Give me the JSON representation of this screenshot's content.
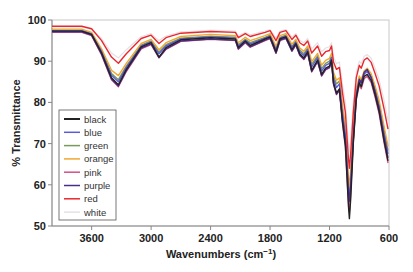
{
  "chart_data": {
    "type": "line",
    "title": "",
    "xlabel": "Wavenumbers (cm⁻¹)",
    "ylabel": "% Transmittance",
    "xlim": [
      4000,
      600
    ],
    "ylim": [
      50,
      100
    ],
    "x_reversed": true,
    "grid": false,
    "legend_position": "inside-left",
    "x_ticks": [
      3600,
      3000,
      2400,
      1800,
      1200,
      600
    ],
    "y_ticks": [
      50,
      60,
      70,
      80,
      90,
      100
    ],
    "x": [
      4000,
      3700,
      3600,
      3500,
      3400,
      3330,
      3250,
      3100,
      3000,
      2920,
      2850,
      2700,
      2400,
      2150,
      2120,
      2050,
      2000,
      1850,
      1800,
      1740,
      1700,
      1640,
      1580,
      1540,
      1500,
      1460,
      1420,
      1380,
      1320,
      1280,
      1240,
      1200,
      1180,
      1160,
      1130,
      1100,
      1070,
      1040,
      1010,
      1000,
      985,
      960,
      930,
      900,
      880,
      850,
      820,
      780,
      740,
      700,
      650,
      610
    ],
    "series": [
      {
        "name": "black",
        "color": "#222222",
        "values": [
          97.3,
          97.3,
          96.5,
          92.0,
          86.0,
          84.3,
          88.0,
          93.5,
          94.5,
          91.0,
          93.3,
          95.2,
          95.7,
          95.4,
          93.3,
          94.9,
          93.8,
          95.4,
          95.9,
          92.3,
          95.4,
          95.9,
          92.8,
          94.3,
          91.8,
          90.8,
          92.3,
          87.8,
          90.3,
          86.8,
          88.3,
          88.8,
          90.3,
          84.8,
          82.3,
          83.3,
          75.5,
          69.5,
          55.0,
          51.8,
          57.0,
          70.0,
          81.0,
          84.8,
          83.8,
          86.3,
          86.8,
          85.3,
          81.8,
          77.8,
          70.8,
          65.8
        ]
      },
      {
        "name": "blue",
        "color": "#5b5bd6",
        "values": [
          97.4,
          97.4,
          96.6,
          92.3,
          86.6,
          85.0,
          88.5,
          93.7,
          94.7,
          91.8,
          93.7,
          95.4,
          95.9,
          95.6,
          93.7,
          95.1,
          94.2,
          95.6,
          96.1,
          92.8,
          95.6,
          96.1,
          93.3,
          94.6,
          92.3,
          91.4,
          92.8,
          88.6,
          90.9,
          87.6,
          89.0,
          89.5,
          90.9,
          85.8,
          83.6,
          84.5,
          77.5,
          72.0,
          59.0,
          56.5,
          61.0,
          72.0,
          82.0,
          85.5,
          84.6,
          86.9,
          87.5,
          86.0,
          82.8,
          79.0,
          72.5,
          67.5
        ]
      },
      {
        "name": "green",
        "color": "#7a9a5a",
        "values": [
          97.5,
          97.5,
          96.7,
          92.6,
          87.0,
          85.5,
          88.8,
          93.9,
          94.9,
          92.2,
          94.0,
          95.6,
          96.1,
          95.8,
          94.0,
          95.3,
          94.5,
          95.8,
          96.3,
          93.1,
          95.8,
          96.3,
          93.6,
          94.9,
          92.7,
          91.8,
          93.2,
          89.2,
          91.3,
          88.2,
          89.5,
          90.0,
          91.3,
          86.5,
          84.5,
          85.2,
          78.5,
          73.0,
          60.5,
          58.0,
          62.5,
          73.0,
          82.6,
          85.9,
          85.0,
          87.2,
          87.8,
          86.4,
          83.3,
          79.7,
          73.3,
          68.3
        ]
      },
      {
        "name": "orange",
        "color": "#f0a830",
        "values": [
          97.8,
          97.8,
          97.0,
          93.0,
          87.8,
          86.5,
          89.5,
          94.3,
          95.3,
          92.8,
          94.5,
          96.0,
          96.5,
          96.2,
          94.5,
          95.8,
          95.0,
          96.2,
          96.7,
          93.6,
          96.2,
          96.7,
          94.1,
          95.3,
          93.2,
          92.4,
          93.7,
          89.9,
          91.9,
          89.0,
          90.2,
          90.7,
          91.9,
          87.3,
          85.4,
          86.0,
          79.5,
          74.0,
          62.0,
          59.5,
          64.0,
          74.0,
          83.2,
          86.4,
          85.5,
          87.7,
          88.3,
          87.0,
          84.0,
          80.5,
          74.3,
          69.3
        ]
      },
      {
        "name": "pink",
        "color": "#d4508a",
        "values": [
          97.0,
          97.0,
          96.2,
          91.5,
          85.5,
          83.8,
          87.5,
          93.0,
          94.0,
          90.8,
          92.9,
          94.8,
          95.3,
          95.0,
          92.9,
          94.5,
          93.4,
          95.0,
          95.5,
          91.9,
          95.0,
          95.5,
          92.4,
          93.9,
          91.4,
          90.4,
          91.9,
          87.4,
          89.9,
          86.4,
          87.9,
          88.4,
          89.9,
          84.4,
          81.9,
          82.9,
          75.0,
          69.0,
          56.0,
          53.5,
          58.5,
          70.5,
          80.6,
          84.3,
          83.3,
          85.8,
          86.3,
          84.8,
          81.3,
          77.3,
          70.3,
          65.3
        ]
      },
      {
        "name": "purple",
        "color": "#4a2d86",
        "values": [
          97.1,
          97.1,
          96.3,
          91.7,
          85.7,
          84.0,
          87.7,
          93.2,
          94.2,
          90.9,
          93.0,
          94.9,
          95.4,
          95.1,
          93.0,
          94.6,
          93.5,
          95.1,
          95.6,
          92.0,
          95.1,
          95.6,
          92.5,
          94.0,
          91.5,
          90.5,
          92.0,
          87.5,
          90.0,
          86.5,
          88.0,
          88.5,
          90.0,
          84.5,
          82.0,
          83.0,
          76.0,
          71.0,
          58.5,
          56.0,
          60.0,
          71.0,
          81.5,
          85.6,
          84.8,
          87.3,
          88.0,
          86.0,
          82.5,
          78.5,
          71.5,
          66.5
        ]
      },
      {
        "name": "red",
        "color": "#e8282d",
        "values": [
          98.5,
          98.5,
          97.9,
          95.0,
          91.0,
          89.5,
          91.8,
          95.5,
          96.3,
          94.3,
          95.7,
          96.8,
          97.2,
          97.0,
          95.7,
          96.7,
          96.0,
          97.0,
          97.4,
          95.0,
          97.0,
          97.4,
          95.3,
          96.3,
          94.5,
          93.8,
          94.9,
          92.0,
          93.7,
          91.2,
          92.3,
          92.6,
          93.7,
          89.8,
          88.0,
          88.5,
          82.5,
          77.5,
          66.5,
          64.0,
          68.0,
          77.5,
          86.0,
          89.0,
          88.3,
          90.3,
          90.8,
          89.7,
          87.0,
          84.0,
          78.5,
          73.5
        ]
      },
      {
        "name": "white",
        "color": "#e6e0e6",
        "values": [
          98.3,
          98.3,
          97.8,
          95.5,
          92.0,
          90.8,
          92.8,
          96.0,
          96.7,
          95.0,
          96.1,
          97.1,
          97.5,
          97.3,
          96.2,
          97.0,
          96.4,
          97.3,
          97.7,
          95.6,
          97.3,
          97.7,
          95.9,
          96.7,
          95.1,
          94.5,
          95.5,
          93.0,
          94.5,
          92.3,
          93.2,
          93.5,
          94.5,
          91.0,
          89.4,
          89.8,
          84.5,
          80.0,
          70.0,
          68.0,
          71.5,
          80.0,
          87.3,
          90.0,
          89.4,
          91.2,
          91.6,
          90.7,
          88.3,
          85.5,
          80.5,
          75.5
        ]
      }
    ]
  },
  "legend": {
    "items": [
      {
        "label": "black",
        "color": "#222222"
      },
      {
        "label": "blue",
        "color": "#5b5bd6"
      },
      {
        "label": "green",
        "color": "#7a9a5a"
      },
      {
        "label": "orange",
        "color": "#f0a830"
      },
      {
        "label": "pink",
        "color": "#d4508a"
      },
      {
        "label": "purple",
        "color": "#4a2d86"
      },
      {
        "label": "red",
        "color": "#e8282d"
      },
      {
        "label": "white",
        "color": "#e6e0e6"
      }
    ]
  },
  "axes": {
    "ylabel": "% Transmittance",
    "xlabel_main": "Wavenumbers (cm",
    "xlabel_sup": "−1",
    "xlabel_close": ")"
  }
}
